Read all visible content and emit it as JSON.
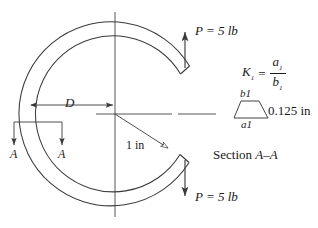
{
  "figure": {
    "stroke_color": "#3a3a3a",
    "text_color": "#1a1a1a",
    "background": "#ffffff"
  },
  "ring": {
    "name": "split-ring",
    "center_x": 115,
    "center_y": 114,
    "outer_radius": 92,
    "inner_radius": 78,
    "gap_side": "right"
  },
  "loads": {
    "top": {
      "symbol": "P",
      "text": "P = 5 lb",
      "direction": "up"
    },
    "bottom": {
      "symbol": "P",
      "text": "P = 5 lb",
      "direction": "down"
    }
  },
  "dimensions": {
    "diameter": {
      "label": "D",
      "style": "italic"
    },
    "radius": {
      "label": "1 in",
      "value": 1,
      "unit": "in"
    },
    "thickness": {
      "label": "0.125 in",
      "value": 0.125,
      "unit": "in"
    }
  },
  "section": {
    "arrow_label_left": "A",
    "arrow_label_right": "A",
    "caption_prefix": "Section ",
    "caption_marks": "A–A"
  },
  "formula": {
    "lhs": "K",
    "lhs_sub": "1",
    "equals": "=",
    "numerator": "a",
    "numerator_sub": "1",
    "denominator": "b",
    "denominator_sub": "1",
    "plain": "K1 = a1 / b1"
  },
  "cross_section": {
    "shape": "trapezoid",
    "top_label": "b1",
    "bottom_label": "a1",
    "side_label": "0.125 in"
  }
}
